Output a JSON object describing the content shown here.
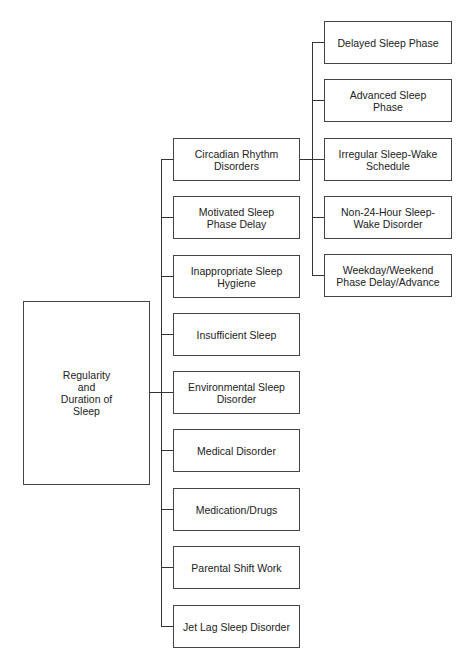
{
  "diagram": {
    "type": "tree",
    "root": {
      "label": "Regularity\nand\nDuration of\nSleep"
    },
    "categories": [
      {
        "label": "Circadian Rhythm\nDisorders",
        "children": [
          {
            "label": "Delayed Sleep Phase"
          },
          {
            "label": "Advanced Sleep\nPhase"
          },
          {
            "label": "Irregular Sleep-Wake\nSchedule"
          },
          {
            "label": "Non-24-Hour Sleep-\nWake Disorder"
          },
          {
            "label": "Weekday/Weekend\nPhase Delay/Advance"
          }
        ]
      },
      {
        "label": "Motivated Sleep\nPhase Delay"
      },
      {
        "label": "Inappropriate Sleep\nHygiene"
      },
      {
        "label": "Insufficient Sleep"
      },
      {
        "label": "Environmental Sleep\nDisorder"
      },
      {
        "label": "Medical Disorder"
      },
      {
        "label": "Medication/Drugs"
      },
      {
        "label": "Parental Shift Work"
      },
      {
        "label": "Jet Lag Sleep Disorder"
      }
    ]
  },
  "colors": {
    "line": "#333333",
    "border": "#444444",
    "background": "#ffffff",
    "text": "#222222"
  }
}
